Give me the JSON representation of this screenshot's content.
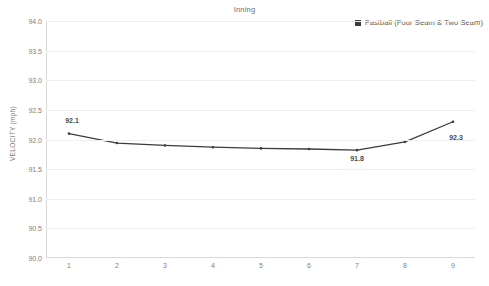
{
  "chart_data": {
    "type": "line",
    "title": "Inning",
    "xlabel": "",
    "ylabel": "VELOCITY (mph)",
    "legend_position": "top-right",
    "grid": "horizontal",
    "ylim": [
      90.0,
      94.0
    ],
    "y_ticks": [
      "94.0",
      "93.5",
      "93.0",
      "92.5",
      "92.0",
      "91.5",
      "91.0",
      "90.5",
      "90.0"
    ],
    "y_tick_values": [
      94.0,
      93.5,
      93.0,
      92.5,
      92.0,
      91.5,
      91.0,
      90.5,
      90.0
    ],
    "categories": [
      "1",
      "2",
      "3",
      "4",
      "5",
      "6",
      "7",
      "8",
      "9"
    ],
    "x": [
      1,
      2,
      3,
      4,
      5,
      6,
      7,
      8,
      9
    ],
    "series": [
      {
        "name": "Fastball (Four Seam & Two Seam)",
        "color": "#3c3c3c",
        "values": [
          92.1,
          91.94,
          91.9,
          91.87,
          91.85,
          91.84,
          91.82,
          91.96,
          92.3
        ]
      }
    ],
    "point_labels": [
      {
        "category": "1",
        "text": "92.1",
        "value": 92.1,
        "position": "above"
      },
      {
        "category": "7",
        "text": "91.8",
        "value": 91.82,
        "position": "below"
      },
      {
        "category": "9",
        "text": "92.3",
        "value": 92.3,
        "position": "below-right"
      }
    ]
  },
  "legend": {
    "marker": "square-marker-icon",
    "label": "Fastball (Four Seam & Two Seam)"
  }
}
